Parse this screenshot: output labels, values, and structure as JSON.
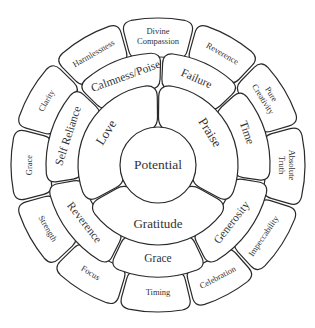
{
  "diagram": {
    "center": {
      "label": "Potential"
    },
    "ring1": [
      {
        "label": "Love",
        "angle": -58
      },
      {
        "label": "Praise",
        "angle": 58
      },
      {
        "label": "Gratitude",
        "angle": 180
      }
    ],
    "ring2": [
      {
        "label": "Calmness/Poise",
        "angle": -20
      },
      {
        "label": "Failure",
        "angle": 24
      },
      {
        "label": "Time",
        "angle": 70
      },
      {
        "label": "Generosity",
        "angle": 128
      },
      {
        "label": "Grace",
        "angle": 180
      },
      {
        "label": "Reverence",
        "angle": -128
      },
      {
        "label": "Self Reliance",
        "angle": -72
      }
    ],
    "ring3": [
      {
        "label": "Divine Compassion",
        "lines": [
          "Divine",
          "Compassion"
        ],
        "angle": 0
      },
      {
        "label": "Reverence",
        "lines": [
          "Reverence"
        ],
        "angle": 30
      },
      {
        "label": "Pure Creativity",
        "lines": [
          "Pure",
          "Creativity"
        ],
        "angle": 58
      },
      {
        "label": "Absolute Truth",
        "lines": [
          "Absolute",
          "Truth"
        ],
        "angle": 90
      },
      {
        "label": "Impeccability",
        "lines": [
          "Impeccability"
        ],
        "angle": 124
      },
      {
        "label": "Celebration",
        "lines": [
          "Celebration"
        ],
        "angle": 152
      },
      {
        "label": "Timing",
        "lines": [
          "Timing"
        ],
        "angle": 180
      },
      {
        "label": "Focus",
        "lines": [
          "Focus"
        ],
        "angle": -148
      },
      {
        "label": "Strength",
        "lines": [
          "Strength"
        ],
        "angle": -120
      },
      {
        "label": "Grace",
        "lines": [
          "Grace"
        ],
        "angle": -90
      },
      {
        "label": "Clarity",
        "lines": [
          "Clarity"
        ],
        "angle": -60
      },
      {
        "label": "Harmlessness",
        "lines": [
          "Harmlessness"
        ],
        "angle": -30
      }
    ]
  }
}
